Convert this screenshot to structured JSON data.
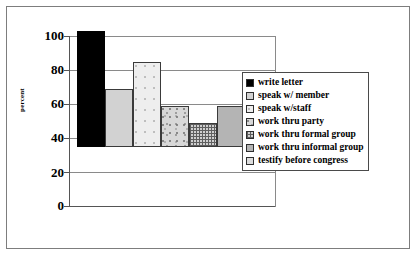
{
  "chart_data": {
    "type": "bar",
    "title": "",
    "xlabel": "",
    "ylabel": "percent",
    "ylim": [
      0,
      100
    ],
    "yticks": [
      0,
      20,
      40,
      60,
      80,
      100
    ],
    "grid": true,
    "legend_position": "right-inside",
    "categories": [
      "write letter",
      "speak w/ member",
      "speak w/staff",
      "work thru party",
      "work thru formal group",
      "work thru informal group",
      "testify before congress"
    ],
    "values": [
      91,
      65,
      68,
      34,
      50,
      24,
      14
    ],
    "fills": [
      "solid-black",
      "light-gray",
      "very-light",
      "speckle",
      "crosshatch",
      "medium-gray",
      "pale"
    ]
  },
  "legend": {
    "items": [
      {
        "label": "write letter",
        "fill": "solid-black"
      },
      {
        "label": "speak w/ member",
        "fill": "light-gray"
      },
      {
        "label": "speak w/staff",
        "fill": "very-light"
      },
      {
        "label": "work thru party",
        "fill": "speckle"
      },
      {
        "label": "work thru formal group",
        "fill": "crosshatch"
      },
      {
        "label": "work thru informal group",
        "fill": "medium-gray"
      },
      {
        "label": "testify before congress",
        "fill": "pale"
      }
    ]
  },
  "axis": {
    "y_title": "percent",
    "y_labels": [
      "100",
      "80",
      "60",
      "40",
      "20",
      "0"
    ]
  },
  "colors": {
    "frame": "#7d7d7d",
    "gridline": "#8a8a8a",
    "axis": "#555555",
    "bar_outline": "#3a3a3a",
    "background": "#ffffff"
  }
}
